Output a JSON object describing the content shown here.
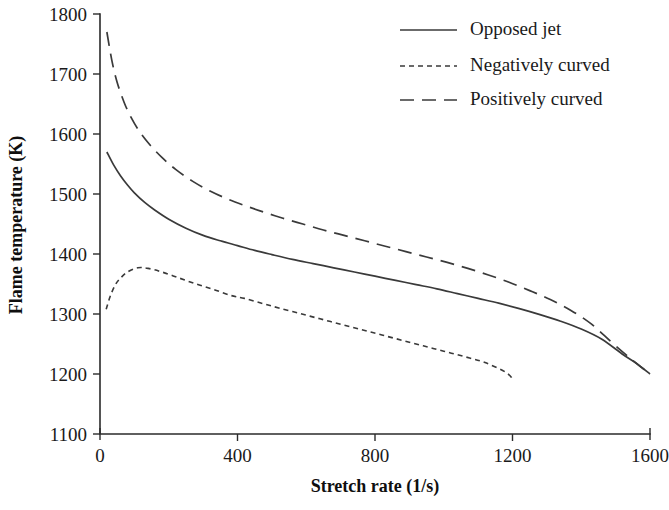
{
  "chart_data": {
    "type": "line",
    "title": "",
    "xlabel": "Stretch rate (1/s)",
    "ylabel": "Flame temperature (K)",
    "xlim": [
      0,
      1600
    ],
    "ylim": [
      1100,
      1800
    ],
    "xticks": [
      0,
      400,
      800,
      1200,
      1600
    ],
    "yticks": [
      1100,
      1200,
      1300,
      1400,
      1500,
      1600,
      1700,
      1800
    ],
    "xtick_labels": [
      "0",
      "400",
      "800",
      "1200",
      "1600"
    ],
    "ytick_labels": [
      "1100",
      "1200",
      "1300",
      "1400",
      "1500",
      "1600",
      "1700",
      "1800"
    ],
    "grid": false,
    "legend_position": "top-right",
    "series": [
      {
        "name": "Opposed jet",
        "line_style": "solid",
        "color": "#3a3a3a",
        "x": [
          20,
          40,
          60,
          80,
          100,
          130,
          160,
          200,
          250,
          300,
          350,
          400,
          450,
          500,
          560,
          620,
          680,
          740,
          800,
          860,
          920,
          980,
          1040,
          1100,
          1160,
          1220,
          1280,
          1340,
          1400,
          1460,
          1520,
          1560,
          1600
        ],
        "y": [
          1570,
          1548,
          1530,
          1515,
          1502,
          1486,
          1473,
          1458,
          1443,
          1431,
          1422,
          1414,
          1406,
          1399,
          1391,
          1384,
          1377,
          1370,
          1363,
          1356,
          1349,
          1342,
          1334,
          1326,
          1318,
          1309,
          1299,
          1288,
          1275,
          1258,
          1233,
          1218,
          1200
        ]
      },
      {
        "name": "Negatively curved",
        "line_style": "dotted",
        "color": "#3a3a3a",
        "x": [
          18,
          30,
          45,
          60,
          80,
          110,
          140,
          180,
          230,
          280,
          330,
          380,
          420,
          470,
          520,
          580,
          640,
          700,
          760,
          820,
          880,
          940,
          1000,
          1060,
          1120,
          1180,
          1200
        ],
        "y": [
          1308,
          1330,
          1349,
          1360,
          1370,
          1377,
          1376,
          1370,
          1360,
          1350,
          1341,
          1331,
          1326,
          1318,
          1310,
          1301,
          1292,
          1283,
          1274,
          1265,
          1256,
          1247,
          1238,
          1229,
          1219,
          1203,
          1192
        ]
      },
      {
        "name": "Positively curved",
        "line_style": "dashed",
        "color": "#3a3a3a",
        "x": [
          20,
          35,
          50,
          70,
          90,
          115,
          145,
          180,
          220,
          270,
          320,
          370,
          420,
          470,
          530,
          590,
          650,
          710,
          770,
          830,
          890,
          950,
          1010,
          1070,
          1130,
          1190,
          1250,
          1310,
          1370,
          1430,
          1490,
          1545,
          1600
        ],
        "y": [
          1770,
          1721,
          1686,
          1653,
          1628,
          1604,
          1582,
          1561,
          1541,
          1521,
          1505,
          1492,
          1481,
          1471,
          1460,
          1450,
          1440,
          1431,
          1422,
          1413,
          1404,
          1395,
          1386,
          1376,
          1365,
          1353,
          1339,
          1324,
          1306,
          1283,
          1252,
          1225,
          1200
        ]
      }
    ]
  },
  "legend": {
    "entries": [
      {
        "label": "Opposed jet",
        "style": "solid"
      },
      {
        "label": "Negatively curved",
        "style": "dotted"
      },
      {
        "label": "Positively curved",
        "style": "dashed"
      }
    ]
  }
}
